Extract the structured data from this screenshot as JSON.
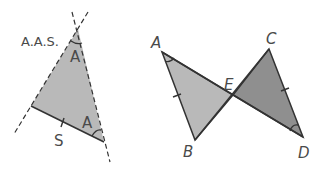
{
  "left_figure": {
    "rule_label": "A.A.S.",
    "angle_labels": [
      "A",
      "A"
    ],
    "side_label": "S",
    "fill": "#b9b9b9",
    "vertices": {
      "apex": [
        78,
        29
      ],
      "left": [
        31,
        106
      ],
      "right": [
        104,
        142
      ]
    }
  },
  "right_figure": {
    "points": {
      "A": {
        "label": "A",
        "xy": [
          162,
          52
        ]
      },
      "B": {
        "label": "B",
        "xy": [
          195,
          140
        ]
      },
      "C": {
        "label": "C",
        "xy": [
          269,
          49
        ]
      },
      "D": {
        "label": "D",
        "xy": [
          303,
          137
        ]
      },
      "E": {
        "label": "E",
        "xy": [
          233,
          95
        ]
      }
    },
    "triangle_ABE_fill": "#b9b9b9",
    "triangle_CDE_fill": "#8f8f8f"
  }
}
